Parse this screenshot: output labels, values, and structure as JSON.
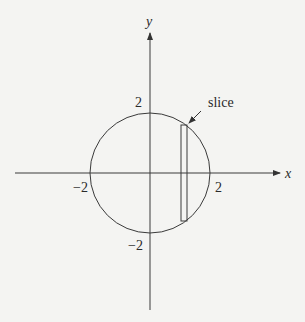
{
  "diagram": {
    "axes": {
      "x_label": "x",
      "y_label": "y"
    },
    "ticks": {
      "x_pos": "2",
      "x_neg": "−2",
      "y_pos": "2",
      "y_neg": "−2"
    },
    "annotation": {
      "label": "slice"
    },
    "circle": {
      "center": [
        0,
        0
      ],
      "radius": 2
    },
    "colors": {
      "stroke": "#3a3a3a",
      "background": "#f4f4f2"
    }
  }
}
